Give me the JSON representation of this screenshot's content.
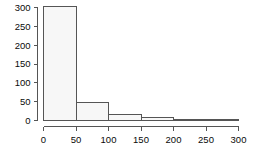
{
  "chart_data": {
    "type": "bar",
    "title": "",
    "subtitle": "",
    "xlabel": "",
    "ylabel": "",
    "bin_width": 50,
    "bin_starts": [
      0,
      50,
      100,
      150,
      200,
      250
    ],
    "bin_ends": [
      50,
      100,
      150,
      200,
      250,
      300
    ],
    "categories": [
      "0-50",
      "50-100",
      "100-150",
      "150-200",
      "200-250",
      "250-300"
    ],
    "values": [
      303,
      48,
      17,
      9,
      1,
      1
    ],
    "xlim": [
      0,
      300
    ],
    "ylim": [
      0,
      300
    ],
    "xticks": [
      0,
      50,
      100,
      150,
      200,
      250,
      300
    ],
    "yticks": [
      0,
      50,
      100,
      150,
      200,
      250,
      300
    ],
    "xtick_labels": [
      "0",
      "50",
      "100",
      "150",
      "200",
      "250",
      "300"
    ],
    "ytick_labels": [
      "0",
      "50",
      "100",
      "150",
      "200",
      "250",
      "300"
    ],
    "grid": false,
    "legend": null,
    "colors": {
      "bar_fill": "#f7f7f7",
      "bar_stroke": "#555555",
      "axis": "#555555",
      "tick_text": "#0a0a0a",
      "background": "#ffffff"
    }
  }
}
